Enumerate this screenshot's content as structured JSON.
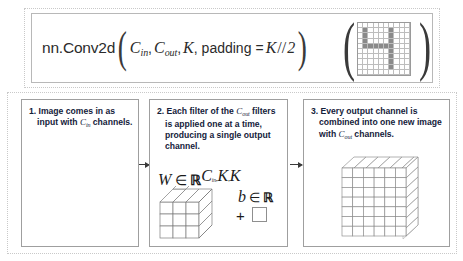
{
  "figure": {
    "header": {
      "formula_plain": "nn.Conv2d(C_in, C_out, K, padding = K//2)",
      "fn_name": "nn.Conv2d",
      "arg_cin": "C",
      "arg_cin_sub": "in",
      "arg_cout": "C",
      "arg_cout_sub": "out",
      "arg_k": "K",
      "arg_padding_label": "padding",
      "equals": "=",
      "arg_k2": "K",
      "slashslash": "//",
      "arg_two": "2",
      "comma": ",",
      "paren_open": "(",
      "paren_close": ")"
    },
    "header_image": {
      "name": "digit-four-pixel-image",
      "rows": 10,
      "cols": 10,
      "on_color": "#8a8a8a",
      "off_color": "#ffffff",
      "pattern": [
        [
          0,
          0,
          0,
          0,
          0,
          0,
          0,
          0,
          0,
          0
        ],
        [
          0,
          1,
          0,
          0,
          0,
          0,
          1,
          0,
          0,
          0
        ],
        [
          0,
          1,
          0,
          0,
          0,
          0,
          1,
          0,
          0,
          0
        ],
        [
          0,
          1,
          0,
          0,
          0,
          0,
          1,
          0,
          0,
          0
        ],
        [
          0,
          1,
          1,
          1,
          1,
          1,
          1,
          0,
          0,
          0
        ],
        [
          0,
          0,
          0,
          0,
          0,
          0,
          1,
          0,
          0,
          0
        ],
        [
          0,
          0,
          0,
          0,
          0,
          0,
          1,
          0,
          0,
          0
        ],
        [
          0,
          0,
          0,
          0,
          0,
          0,
          1,
          0,
          0,
          0
        ],
        [
          0,
          0,
          0,
          0,
          0,
          0,
          1,
          0,
          0,
          0
        ],
        [
          0,
          0,
          0,
          0,
          0,
          0,
          0,
          0,
          0,
          0
        ]
      ]
    },
    "panels": [
      {
        "id": "panel-1",
        "number": "1.",
        "text": "Image comes in as input with ",
        "math_symbol": "C",
        "math_sub": "in",
        "text_tail": " channels.",
        "image": {
          "name": "input-digit-four-image",
          "rows": 10,
          "cols": 10,
          "pattern": [
            [
              0,
              0,
              0,
              0,
              0,
              0,
              0,
              0,
              0,
              0
            ],
            [
              0,
              1,
              0,
              0,
              0,
              0,
              1,
              0,
              0,
              0
            ],
            [
              0,
              1,
              0,
              0,
              0,
              0,
              1,
              0,
              0,
              0
            ],
            [
              0,
              1,
              0,
              0,
              0,
              0,
              1,
              0,
              0,
              0
            ],
            [
              0,
              1,
              1,
              1,
              1,
              1,
              1,
              0,
              0,
              0
            ],
            [
              0,
              0,
              0,
              0,
              0,
              0,
              1,
              0,
              0,
              0
            ],
            [
              0,
              0,
              0,
              0,
              0,
              0,
              1,
              0,
              0,
              0
            ],
            [
              0,
              0,
              0,
              0,
              0,
              0,
              1,
              0,
              0,
              0
            ],
            [
              0,
              0,
              0,
              0,
              0,
              0,
              1,
              0,
              0,
              0
            ],
            [
              0,
              0,
              0,
              0,
              0,
              0,
              0,
              0,
              0,
              0
            ]
          ]
        }
      },
      {
        "id": "panel-2",
        "number": "2.",
        "text": "Each filter of the ",
        "math_symbol": "C",
        "math_sub": "out",
        "text_tail": " filters is applied one at a time, producing a single output channel.",
        "weights": {
          "W": "W",
          "in_symbol": "∈",
          "R": "ℝ",
          "sup_c": "C",
          "sup_c_sub": "in",
          "sup_k1": "K",
          "sup_k2": "K",
          "sup_plain": "C_in,K,K",
          "cube_dims": [
            3,
            3,
            3
          ]
        },
        "bias": {
          "b": "b",
          "in_symbol": "∈",
          "R": "ℝ",
          "plus": "+"
        }
      },
      {
        "id": "panel-3",
        "number": "3.",
        "text": "Every output channel is combined into one new image with ",
        "math_symbol": "C",
        "math_sub": "out",
        "text_tail": " channels.",
        "cube": {
          "name": "output-channel-stack",
          "cols": 6,
          "rows": 7,
          "depth_layers": 4
        }
      }
    ],
    "arrows": [
      {
        "name": "arrow-panel1-to-panel2"
      },
      {
        "name": "arrow-panel2-to-panel3"
      }
    ],
    "colors": {
      "text": "#14213a",
      "formula_text": "#2b2b2b",
      "border": "#9f9f9f",
      "grid_line": "#bdbdbd",
      "pixel_on": "#8a8a8a",
      "dashed_frame": "#c9c9c9",
      "background": "#ffffff"
    }
  }
}
